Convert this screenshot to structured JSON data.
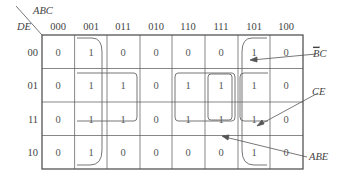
{
  "kmap": {
    "row_var": "DE",
    "col_var": "ABC",
    "columns": [
      "000",
      "001",
      "011",
      "010",
      "110",
      "111",
      "101",
      "100"
    ],
    "rows": [
      "00",
      "01",
      "11",
      "10"
    ],
    "cells": [
      [
        "0",
        "1",
        "0",
        "0",
        "0",
        "0",
        "1",
        "0"
      ],
      [
        "0",
        "1",
        "1",
        "0",
        "1",
        "1",
        "1",
        "0"
      ],
      [
        "0",
        "1",
        "1",
        "0",
        "1",
        "1",
        "1",
        "0"
      ],
      [
        "0",
        "1",
        "0",
        "0",
        "0",
        "0",
        "1",
        "0"
      ]
    ],
    "annotations": {
      "bc_bar": {
        "bar_part": "B",
        "rest": "C"
      },
      "ce": "CE",
      "abe": "ABE"
    }
  }
}
